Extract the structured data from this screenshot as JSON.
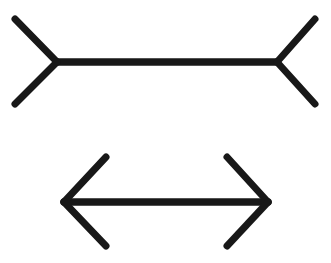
{
  "figure": {
    "name": "Muller-Lyer illusion",
    "background_color": "#ffffff",
    "stroke_color": "#181818",
    "stroke_width": 7,
    "line_cap": "round",
    "canvas": {
      "width": 331,
      "height": 263
    }
  },
  "shapes": [
    {
      "id": "top-figure",
      "label": "fins-outward arrow figure",
      "description": "Horizontal shaft with outward-pointing (reversed) arrowheads at both ends",
      "shaft": {
        "x1": 57,
        "y1": 62,
        "x2": 277,
        "y2": 62,
        "length": 220
      },
      "fins": [
        {
          "name": "top-left-fin",
          "x1": 57,
          "y1": 62,
          "x2": 15,
          "y2": 19
        },
        {
          "name": "bottom-left-fin",
          "x1": 57,
          "y1": 62,
          "x2": 15,
          "y2": 104
        },
        {
          "name": "top-right-fin",
          "x1": 277,
          "y1": 62,
          "x2": 315,
          "y2": 19
        },
        {
          "name": "bottom-right-fin",
          "x1": 277,
          "y1": 62,
          "x2": 315,
          "y2": 104
        }
      ]
    },
    {
      "id": "bottom-figure",
      "label": "fins-inward double arrow figure",
      "description": "Horizontal shaft with inward-pointing arrowheads at both ends",
      "shaft": {
        "x1": 64,
        "y1": 202,
        "x2": 268,
        "y2": 202,
        "length": 204
      },
      "fins": [
        {
          "name": "top-left-fin",
          "x1": 64,
          "y1": 202,
          "x2": 106,
          "y2": 157
        },
        {
          "name": "bottom-left-fin",
          "x1": 64,
          "y1": 202,
          "x2": 106,
          "y2": 246
        },
        {
          "name": "top-right-fin",
          "x1": 268,
          "y1": 202,
          "x2": 227,
          "y2": 157
        },
        {
          "name": "bottom-right-fin",
          "x1": 268,
          "y1": 202,
          "x2": 227,
          "y2": 246
        }
      ]
    }
  ]
}
